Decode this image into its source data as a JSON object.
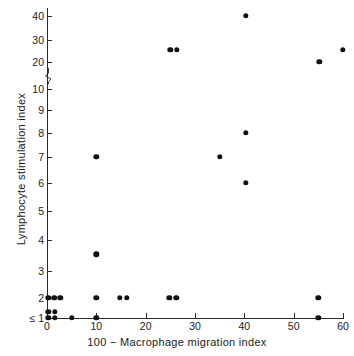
{
  "chart_data": {
    "type": "scatter",
    "title": "",
    "xlabel": "100 − Macrophage migration index",
    "ylabel": "Lymphocyte  stimulation index",
    "xlim": [
      0,
      60
    ],
    "xticks": [
      0,
      10,
      20,
      30,
      40,
      50,
      60
    ],
    "xticklabels": [
      "0",
      "10",
      "20",
      "30",
      "40",
      "50",
      "60"
    ],
    "yscale": "log-broken",
    "yticks": [
      1,
      2,
      3,
      4,
      5,
      6,
      7,
      8,
      9,
      10,
      20,
      30,
      40
    ],
    "yticklabels": [
      "≤ 1",
      "2",
      "3",
      "4",
      "5",
      "6",
      "7",
      "8",
      "9",
      "10",
      "20",
      "30",
      "40"
    ],
    "grid": false,
    "legend": null,
    "axis_break": true,
    "axis_break_between": [
      10,
      20
    ],
    "marker": "filled-circle",
    "marker_color": "#111111",
    "points": [
      {
        "x": 0.3,
        "y": 1.25
      },
      {
        "x": 0.3,
        "y": 1.0
      },
      {
        "x": 1.6,
        "y": 1.25
      },
      {
        "x": 1.6,
        "y": 1.0
      },
      {
        "x": 0.3,
        "y": 2
      },
      {
        "x": 1.5,
        "y": 2
      },
      {
        "x": 2.7,
        "y": 2
      },
      {
        "x": 5.0,
        "y": 1.0
      },
      {
        "x": 10.0,
        "y": 1.0
      },
      {
        "x": 10.0,
        "y": 2
      },
      {
        "x": 10.0,
        "y": 3.5
      },
      {
        "x": 10.0,
        "y": 7
      },
      {
        "x": 14.8,
        "y": 2
      },
      {
        "x": 16.2,
        "y": 2
      },
      {
        "x": 24.8,
        "y": 2
      },
      {
        "x": 26.2,
        "y": 2
      },
      {
        "x": 25.0,
        "y": 25
      },
      {
        "x": 26.3,
        "y": 25
      },
      {
        "x": 35.0,
        "y": 7
      },
      {
        "x": 40.3,
        "y": 40
      },
      {
        "x": 40.3,
        "y": 8
      },
      {
        "x": 40.3,
        "y": 6
      },
      {
        "x": 55.0,
        "y": 1.0
      },
      {
        "x": 55.0,
        "y": 2
      },
      {
        "x": 55.2,
        "y": 20
      },
      {
        "x": 60.0,
        "y": 25
      }
    ]
  },
  "axis_ticks": {
    "y_pixel_map": [
      {
        "label": "40",
        "px": 16
      },
      {
        "label": "30",
        "px": 40
      },
      {
        "label": "20",
        "px": 62
      },
      {
        "label": "10",
        "px": 89
      },
      {
        "label": "9",
        "px": 110
      },
      {
        "label": "8",
        "px": 133
      },
      {
        "label": "7",
        "px": 157
      },
      {
        "label": "6",
        "px": 183
      },
      {
        "label": "5",
        "px": 211
      },
      {
        "label": "4",
        "px": 240
      },
      {
        "label": "3",
        "px": 271
      },
      {
        "label": "2",
        "px": 298
      },
      {
        "label": "≤ 1",
        "px": 318
      }
    ]
  }
}
